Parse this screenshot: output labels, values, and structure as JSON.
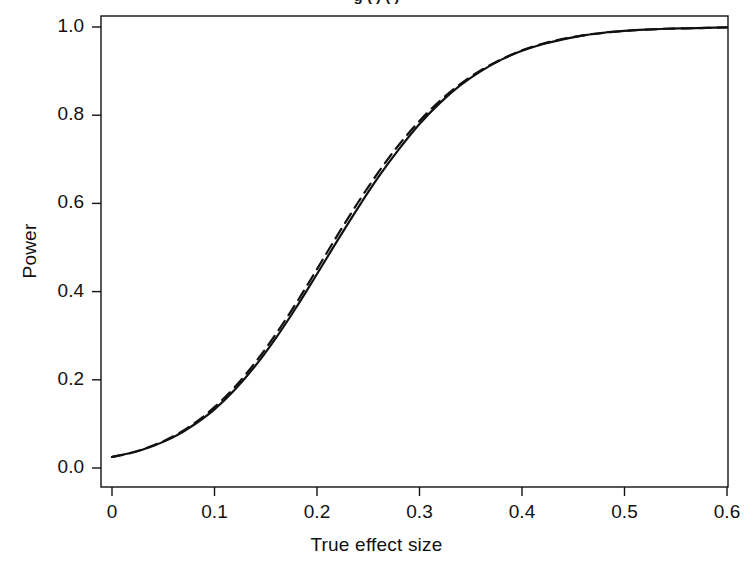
{
  "figure": {
    "clipped_title_fragment": "g ( ) ( )",
    "background": "#ffffff",
    "ink_color": "#111111"
  },
  "chart_data": {
    "type": "line",
    "title": "",
    "xlabel": "True effect size",
    "ylabel": "Power",
    "xlim": [
      0,
      0.6
    ],
    "ylim": [
      0,
      1.0
    ],
    "xticks": [
      "0",
      "0.1",
      "0.2",
      "0.3",
      "0.4",
      "0.5",
      "0.6"
    ],
    "xtick_values": [
      0,
      0.1,
      0.2,
      0.3,
      0.4,
      0.5,
      0.6
    ],
    "yticks": [
      "0.0",
      "0.2",
      "0.4",
      "0.6",
      "0.8",
      "1.0"
    ],
    "ytick_values": [
      0.0,
      0.2,
      0.4,
      0.6,
      0.8,
      1.0
    ],
    "grid": false,
    "legend": "none",
    "box": true,
    "x": [
      0.0,
      0.02,
      0.04,
      0.06,
      0.08,
      0.1,
      0.12,
      0.14,
      0.16,
      0.18,
      0.2,
      0.22,
      0.24,
      0.26,
      0.28,
      0.3,
      0.32,
      0.34,
      0.36,
      0.38,
      0.4,
      0.42,
      0.44,
      0.46,
      0.48,
      0.5,
      0.52,
      0.54,
      0.56,
      0.58,
      0.6
    ],
    "series": [
      {
        "name": "solid curve",
        "style": "solid",
        "color": "#111111",
        "linewidth": 2.2,
        "values": [
          0.025,
          0.035,
          0.05,
          0.07,
          0.098,
          0.133,
          0.178,
          0.232,
          0.295,
          0.365,
          0.44,
          0.516,
          0.59,
          0.66,
          0.723,
          0.78,
          0.828,
          0.868,
          0.9,
          0.926,
          0.946,
          0.961,
          0.972,
          0.981,
          0.987,
          0.991,
          0.994,
          0.996,
          0.997,
          0.998,
          0.999
        ]
      },
      {
        "name": "dashed curve",
        "style": "dashed",
        "color": "#111111",
        "linewidth": 2.2,
        "values": [
          0.025,
          0.035,
          0.051,
          0.072,
          0.101,
          0.138,
          0.184,
          0.24,
          0.304,
          0.375,
          0.451,
          0.528,
          0.602,
          0.671,
          0.733,
          0.787,
          0.833,
          0.871,
          0.902,
          0.927,
          0.947,
          0.962,
          0.973,
          0.981,
          0.987,
          0.991,
          0.994,
          0.996,
          0.997,
          0.998,
          0.999
        ]
      }
    ]
  },
  "geometry": {
    "plot_left": 101,
    "plot_right": 728,
    "plot_top": 16,
    "plot_bottom": 487,
    "x0_px": 112,
    "x_px_per_unit": 1025,
    "y0_px": 468,
    "y1_px": 27
  }
}
